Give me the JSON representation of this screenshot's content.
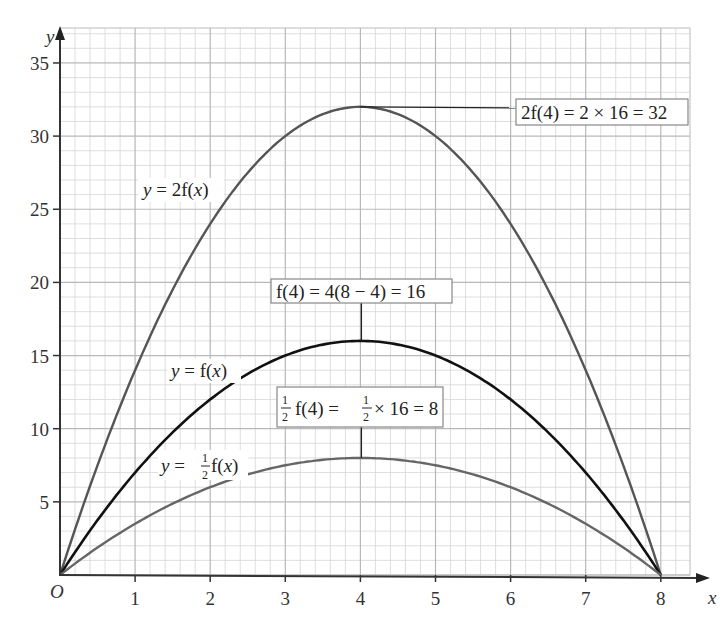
{
  "chart_data": {
    "type": "line",
    "title": "",
    "xlabel": "x",
    "ylabel": "y",
    "origin_label": "O",
    "xlim": [
      0,
      8.2
    ],
    "ylim": [
      0,
      36
    ],
    "x_ticks": [
      1,
      2,
      3,
      4,
      5,
      6,
      7,
      8
    ],
    "y_ticks": [
      5,
      10,
      15,
      20,
      25,
      30,
      35
    ],
    "grid": {
      "major": 1,
      "minor_x": 0.2,
      "minor_y": 1,
      "on": true
    },
    "function": "f(x) = x(8 - x)",
    "series": [
      {
        "name": "y = 2f(x)",
        "color": "#555555",
        "x": [
          0,
          1,
          2,
          3,
          4,
          5,
          6,
          7,
          8
        ],
        "values": [
          0,
          14,
          24,
          30,
          32,
          30,
          24,
          14,
          0
        ]
      },
      {
        "name": "y = f(x)",
        "color": "#111111",
        "x": [
          0,
          1,
          2,
          3,
          4,
          5,
          6,
          7,
          8
        ],
        "values": [
          0,
          7,
          12,
          15,
          16,
          15,
          12,
          7,
          0
        ]
      },
      {
        "name": "y = 1/2 f(x)",
        "color": "#666666",
        "x": [
          0,
          1,
          2,
          3,
          4,
          5,
          6,
          7,
          8
        ],
        "values": [
          0,
          3.5,
          6,
          7.5,
          8,
          7.5,
          6,
          3.5,
          0
        ]
      }
    ],
    "annotations": [
      {
        "text": "2f(4) = 2 × 16 = 32",
        "point": [
          4,
          32
        ]
      },
      {
        "text": "f(4) = 4(8 − 4) = 16",
        "point": [
          4,
          16
        ]
      },
      {
        "text": "1/2 f(4) = 1/2 × 16 = 8",
        "point": [
          4,
          8
        ]
      }
    ],
    "curve_labels": [
      {
        "text": "y = 2f(x)",
        "series": 0
      },
      {
        "text": "y = f(x)",
        "series": 1
      },
      {
        "text": "y = 1/2 f(x)",
        "series": 2
      }
    ]
  },
  "labels": {
    "x_axis": "x",
    "y_axis": "y",
    "origin": "O",
    "x_ticks": [
      "1",
      "2",
      "3",
      "4",
      "5",
      "6",
      "7",
      "8"
    ],
    "y_ticks": [
      "5",
      "10",
      "15",
      "20",
      "25",
      "30",
      "35"
    ],
    "annot_2f": "2f(4) = 2 × 16 = 32",
    "annot_f": "f(4) = 4(8 − 4) = 16",
    "annot_half": {
      "prefix_num": "1",
      "prefix_den": "2",
      "mid": "f(4) = ",
      "num2": "1",
      "den2": "2",
      "tail": "× 16 = 8"
    },
    "curve_2f": {
      "y": "y",
      "eq": " = 2f(",
      "x": "x",
      "close": ")"
    },
    "curve_f": {
      "y": "y",
      "eq": " = f(",
      "x": "x",
      "close": ")"
    },
    "curve_half": {
      "y": "y",
      "eq": " = ",
      "num": "1",
      "den": "2",
      "fx": " f(",
      "x": "x",
      "close": ")"
    }
  }
}
